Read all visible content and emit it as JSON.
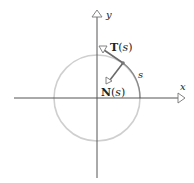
{
  "diagram": {
    "type": "unit-circle-frenet-frame",
    "axes": {
      "x_label": "x",
      "y_label": "y"
    },
    "circle": {
      "center": [
        97,
        98
      ],
      "radius": 43,
      "color": "#cfcfcf"
    },
    "arc": {
      "label": "s",
      "color": "#888888"
    },
    "point": {
      "position": [
        123,
        63
      ]
    },
    "vectors": {
      "tangent": {
        "label_main": "T",
        "label_paren_open": "(",
        "label_arg": "s",
        "label_paren_close": ")"
      },
      "normal": {
        "label_main": "N",
        "label_paren_open": "(",
        "label_arg": "s",
        "label_paren_close": ")"
      }
    }
  }
}
